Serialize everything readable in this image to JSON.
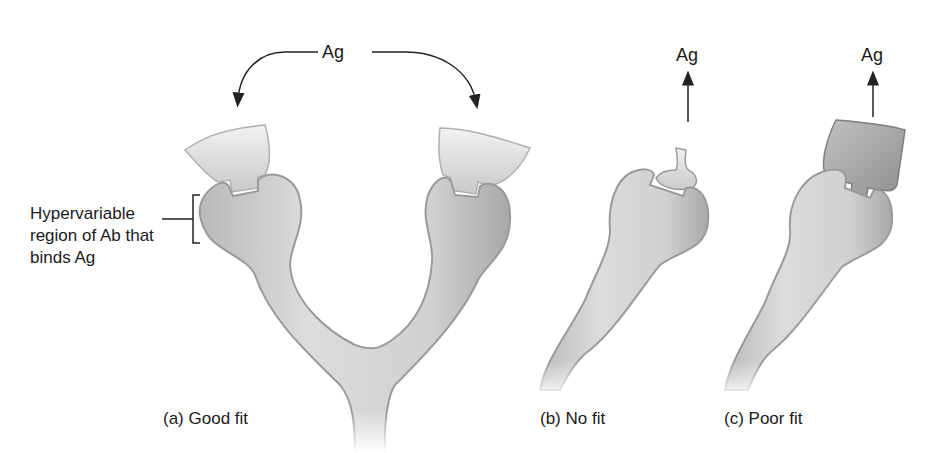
{
  "figure": {
    "antigen_labels": {
      "a_shared": "Ag",
      "b": "Ag",
      "c": "Ag"
    },
    "hypervariable_label": {
      "line1": "Hypervariable",
      "line2": "region of Ab that",
      "line3": "binds Ag"
    },
    "panels": [
      {
        "id": "a",
        "caption": "(a) Good fit"
      },
      {
        "id": "b",
        "caption": "(b) No fit"
      },
      {
        "id": "c",
        "caption": "(c) Poor fit"
      }
    ],
    "colors": {
      "antibody_fill": "#d2d2d2",
      "antibody_edge": "#9a9a9a",
      "antigen_fill": "#cfcfcf",
      "antigen_dark": "#8c8c8c",
      "arrow": "#222222",
      "background": "#ffffff"
    }
  }
}
